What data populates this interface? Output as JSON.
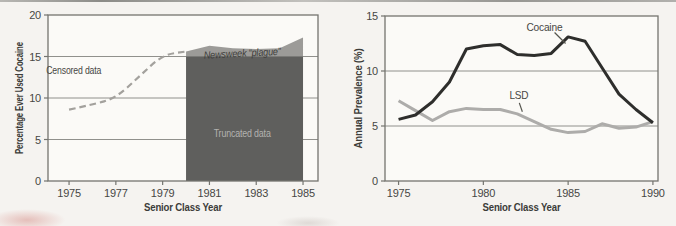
{
  "page": {
    "background": "#f5f3f0"
  },
  "chart_data": [
    {
      "type": "area",
      "title": "",
      "xlabel": "Senior Class Year",
      "ylabel": "Percentage Ever Used Cocaine",
      "xlim": [
        1974.1,
        1985.64
      ],
      "ylim": [
        0,
        20
      ],
      "xticks": [
        1975,
        1977,
        1979,
        1981,
        1983,
        1985
      ],
      "yticks": [
        0,
        5,
        10,
        15,
        20
      ],
      "grid_values": [
        5,
        10,
        15
      ],
      "grid": "horizontal",
      "series": [
        {
          "name": "Censored data",
          "kind": "dashed",
          "smooth": true,
          "color": "#a3a19d",
          "width": 2.2,
          "x": [
            1975,
            1976,
            1977,
            1978,
            1979,
            1980
          ],
          "values": [
            8.6,
            9.2,
            10.0,
            12.6,
            15.2,
            15.6
          ]
        },
        {
          "name": "Actual lifetime use",
          "kind": "area",
          "color": "#9c9b98",
          "baseline": 15,
          "x": [
            1980,
            1981,
            1982,
            1983,
            1984,
            1985
          ],
          "values": [
            15.6,
            16.3,
            16.0,
            15.9,
            16.0,
            17.3
          ]
        },
        {
          "name": "Truncated data",
          "kind": "block",
          "color": "#5f5f5d",
          "x": [
            1980,
            1985
          ],
          "value": 15
        }
      ],
      "annotations": [
        {
          "text": "Censored data",
          "x": 1975.2,
          "y": 13.4,
          "class": "",
          "w": 55
        },
        {
          "text": "Truncated data",
          "x": 1982.4,
          "y": 5.8,
          "class": "anno-light",
          "w": 57
        },
        {
          "text": "Newsweek “plague”",
          "x": 1982.4,
          "y": 15.45,
          "class": "anno-italic",
          "w": 77,
          "rot": -3
        }
      ]
    },
    {
      "type": "line",
      "title": "",
      "xlabel": "Senior Class Year",
      "ylabel": "Annual Prevalence (%)",
      "xlim": [
        1974.2,
        1990.3
      ],
      "ylim": [
        0,
        15
      ],
      "xticks": [
        1975,
        1980,
        1985,
        1990
      ],
      "yticks": [
        0,
        5,
        10,
        15
      ],
      "grid_values": [
        5,
        10
      ],
      "grid": "horizontal",
      "series": [
        {
          "name": "LSD",
          "kind": "line",
          "color": "#adacaa",
          "width": 3,
          "x": [
            1975,
            1976,
            1977,
            1978,
            1979,
            1980,
            1981,
            1982,
            1983,
            1984,
            1985,
            1986,
            1987,
            1988,
            1989,
            1990
          ],
          "values": [
            7.3,
            6.4,
            5.5,
            6.3,
            6.6,
            6.5,
            6.5,
            6.1,
            5.4,
            4.7,
            4.4,
            4.5,
            5.2,
            4.8,
            4.9,
            5.4
          ]
        },
        {
          "name": "Cocaine",
          "kind": "line",
          "color": "#2e2e2c",
          "width": 3,
          "x": [
            1975,
            1976,
            1977,
            1978,
            1979,
            1980,
            1981,
            1982,
            1983,
            1984,
            1985,
            1986,
            1987,
            1988,
            1989,
            1990
          ],
          "values": [
            5.6,
            6.0,
            7.2,
            9.0,
            12.0,
            12.3,
            12.4,
            11.5,
            11.4,
            11.6,
            13.1,
            12.7,
            10.3,
            7.9,
            6.5,
            5.3
          ]
        }
      ],
      "annotations": [
        {
          "text": "Cocaine",
          "x": 1983.6,
          "y": 14.0,
          "class": "",
          "w": 36,
          "leader": [
            1984.2,
            13.5,
            1984.85,
            12.5
          ]
        },
        {
          "text": "LSD",
          "x": 1982.1,
          "y": 7.8,
          "class": "",
          "w": 19,
          "leader": [
            1982.12,
            7.1,
            1982.3,
            6.3
          ]
        }
      ]
    }
  ]
}
